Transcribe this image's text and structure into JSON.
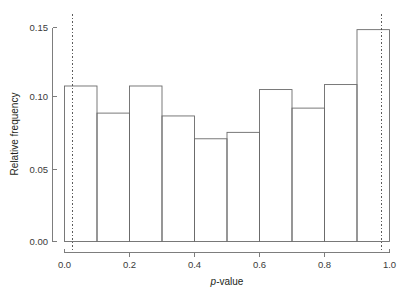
{
  "chart_data": {
    "type": "bar",
    "title": "",
    "subtitle": "",
    "xlabel": "p-value",
    "xlabel_italic_prefix": "p",
    "xlabel_rest": "-value",
    "ylabel": "Relative frequency",
    "xlim": [
      0.0,
      1.0
    ],
    "ylim": [
      0.0,
      0.155
    ],
    "grid": false,
    "legend": null,
    "bin_width": 0.1,
    "bin_edges": [
      0.0,
      0.1,
      0.2,
      0.3,
      0.4,
      0.5,
      0.6,
      0.7,
      0.8,
      0.9,
      1.0
    ],
    "categories": [
      "0.0-0.1",
      "0.1-0.2",
      "0.2-0.3",
      "0.3-0.4",
      "0.4-0.5",
      "0.5-0.6",
      "0.6-0.7",
      "0.7-0.8",
      "0.8-0.9",
      "0.9-1.0"
    ],
    "values": [
      0.109,
      0.09,
      0.109,
      0.088,
      0.072,
      0.0765,
      0.1065,
      0.0935,
      0.11,
      0.1485
    ],
    "x_ticks": [
      0.0,
      0.2,
      0.4,
      0.6,
      0.8,
      1.0
    ],
    "x_tick_labels": [
      "0.0",
      "0.2",
      "0.4",
      "0.6",
      "0.8",
      "1.0"
    ],
    "x_minor_ticks": [
      0.1,
      0.3,
      0.5,
      0.7,
      0.9
    ],
    "y_ticks": [
      0.0,
      0.05,
      0.1,
      0.15
    ],
    "y_tick_labels": [
      "0.00",
      "0.05",
      "0.10",
      "0.15"
    ],
    "annotations": [
      {
        "name": "lower-reference-line",
        "type": "vline",
        "x": 0.025,
        "style": "dashed"
      },
      {
        "name": "upper-reference-line",
        "type": "vline",
        "x": 0.975,
        "style": "dashed"
      }
    ],
    "colors": {
      "bar_outline": "#6b6b6b",
      "bar_fill": "#ffffff",
      "axis": "#6f6f6f",
      "reference_line": "#4a4a4a",
      "text": "#231f20",
      "background": "#ffffff"
    }
  }
}
